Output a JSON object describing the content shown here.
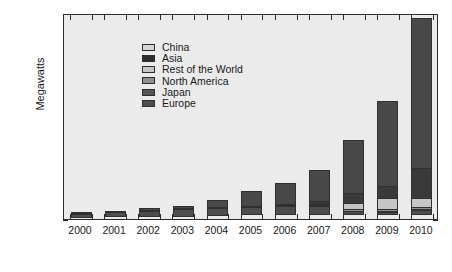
{
  "chart_data": {
    "type": "bar",
    "stacked": true,
    "title": "",
    "xlabel": "",
    "ylabel": "Megawatts",
    "ylim": [
      0,
      40000
    ],
    "ytick_values": [
      0,
      5000,
      10000,
      15000,
      20000,
      25000,
      30000,
      35000,
      40000
    ],
    "ytick_labels": [
      "0",
      "5,000",
      "10,000",
      "15,000",
      "20,000",
      "25,000",
      "30,000",
      "35,000",
      "40,000"
    ],
    "grid": false,
    "legend_position": "upper-left-inside",
    "categories": [
      "2000",
      "2001",
      "2002",
      "2003",
      "2004",
      "2005",
      "2006",
      "2007",
      "2008",
      "2009",
      "2010"
    ],
    "series": [
      {
        "name": "Europe",
        "color": "#4d4d4d",
        "values": [
          800,
          1050,
          1250,
          1400,
          1500,
          1600,
          1700,
          1800,
          750,
          700,
          1000
        ]
      },
      {
        "name": "Japan",
        "color": "#565656",
        "values": [
          110,
          120,
          140,
          160,
          180,
          200,
          230,
          260,
          280,
          300,
          320
        ]
      },
      {
        "name": "North America",
        "color": "#8f8f8f",
        "values": [
          80,
          90,
          100,
          120,
          160,
          200,
          260,
          320,
          400,
          500,
          600
        ]
      },
      {
        "name": "Rest of the World",
        "color": "#c6c6c6",
        "values": [
          60,
          70,
          90,
          110,
          150,
          190,
          250,
          330,
          1300,
          2350,
          1900
        ]
      },
      {
        "name": "Asia",
        "color": "#3a3a3a",
        "values": [
          60,
          70,
          80,
          110,
          160,
          220,
          400,
          700,
          2200,
          2350,
          6000
        ]
      },
      {
        "name": "China",
        "color": "#484848",
        "values": [
          200,
          250,
          400,
          650,
          1600,
          3000,
          4100,
          6200,
          10500,
          16700,
          29200
        ]
      }
    ]
  },
  "legend": {
    "items": [
      {
        "label": "China",
        "color": "#d6d6d6"
      },
      {
        "label": "Asia",
        "color": "#2d2d2d"
      },
      {
        "label": "Rest of the World",
        "color": "#c6c6c6"
      },
      {
        "label": "North America",
        "color": "#8f8f8f"
      },
      {
        "label": "Japan",
        "color": "#565656"
      },
      {
        "label": "Europe",
        "color": "#4d4d4d"
      }
    ]
  },
  "axes": {
    "y_title": "Megawatts"
  }
}
